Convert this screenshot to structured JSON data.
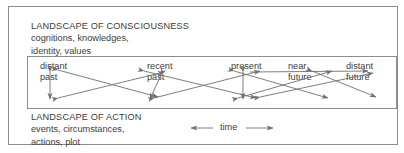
{
  "figure": {
    "name": "landscape-of-consciousness-and-action-diagram",
    "stroke_color": "#8d8d8d",
    "text_color": "#3c3c3c",
    "background": "#ffffff"
  },
  "consciousness": {
    "title": "LANDSCAPE OF CONSCIOUSNESS",
    "line1": "cognitions, knowledges,",
    "line2": "identity, values"
  },
  "action": {
    "title": "LANDSCAPE OF ACTION",
    "line1": "events, circumstances,",
    "line2": "actions, plot"
  },
  "timeline": {
    "labels": [
      {
        "id": "distant-past",
        "line1": "distant",
        "line2": "past"
      },
      {
        "id": "recent-past",
        "line1": "recent",
        "line2": "past"
      },
      {
        "id": "present",
        "line1": "present",
        "line2": ""
      },
      {
        "id": "near-future",
        "line1": "near",
        "line2": "future"
      },
      {
        "id": "distant-future",
        "line1": "distant",
        "line2": "future"
      }
    ]
  },
  "time_axis": {
    "label": "time",
    "left_arrow": "left-arrowhead-icon",
    "right_arrow": "right-arrowhead-icon"
  }
}
